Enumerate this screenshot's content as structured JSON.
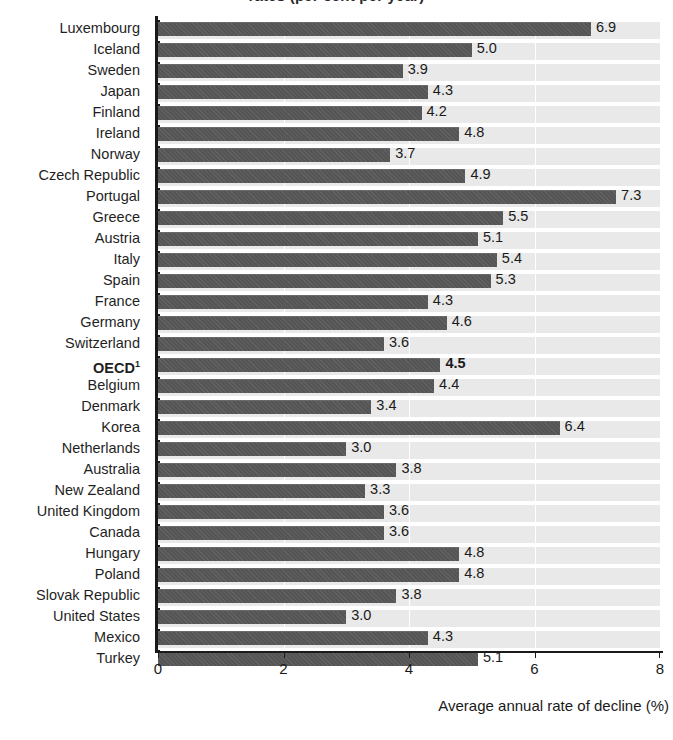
{
  "title": "rates (per cent per year)",
  "axis": {
    "x_title": "Average annual rate of decline (%)",
    "x_ticks": [
      "0",
      "2",
      "4",
      "6",
      "8"
    ],
    "x_min": 0,
    "x_max": 8
  },
  "footnote_marker": "1",
  "chart_data": {
    "type": "bar",
    "orientation": "horizontal",
    "title": "rates (per cent per year)",
    "xlabel": "Average annual rate of decline (%)",
    "ylabel": "",
    "xlim": [
      0,
      8
    ],
    "xticks": [
      0,
      2,
      4,
      6,
      8
    ],
    "grid": true,
    "legend": false,
    "highlight_category": "OECD",
    "categories": [
      "Luxembourg",
      "Iceland",
      "Sweden",
      "Japan",
      "Finland",
      "Ireland",
      "Norway",
      "Czech Republic",
      "Portugal",
      "Greece",
      "Austria",
      "Italy",
      "Spain",
      "France",
      "Germany",
      "Switzerland",
      "OECD",
      "Belgium",
      "Denmark",
      "Korea",
      "Netherlands",
      "Australia",
      "New Zealand",
      "United Kingdom",
      "Canada",
      "Hungary",
      "Poland",
      "Slovak Republic",
      "United States",
      "Mexico",
      "Turkey"
    ],
    "values": [
      6.9,
      5.0,
      3.9,
      4.3,
      4.2,
      4.8,
      3.7,
      4.9,
      7.3,
      5.5,
      5.1,
      5.4,
      5.3,
      4.3,
      4.6,
      3.6,
      4.5,
      4.4,
      3.4,
      6.4,
      3.0,
      3.8,
      3.3,
      3.6,
      3.6,
      4.8,
      4.8,
      3.8,
      3.0,
      4.3,
      5.1
    ],
    "value_labels": [
      "6.9",
      "5.0",
      "3.9",
      "4.3",
      "4.2",
      "4.8",
      "3.7",
      "4.9",
      "7.3",
      "5.5",
      "5.1",
      "5.4",
      "5.3",
      "4.3",
      "4.6",
      "3.6",
      "4.5",
      "4.4",
      "3.4",
      "6.4",
      "3.0",
      "3.8",
      "3.3",
      "3.6",
      "3.6",
      "4.8",
      "4.8",
      "3.8",
      "3.0",
      "4.3",
      "5.1"
    ]
  },
  "colors": {
    "bar": "#555555",
    "plot_background": "#e9e9e9",
    "gridline": "#ffffff",
    "axis": "#1a1a1a",
    "text": "#1a1a1a"
  }
}
